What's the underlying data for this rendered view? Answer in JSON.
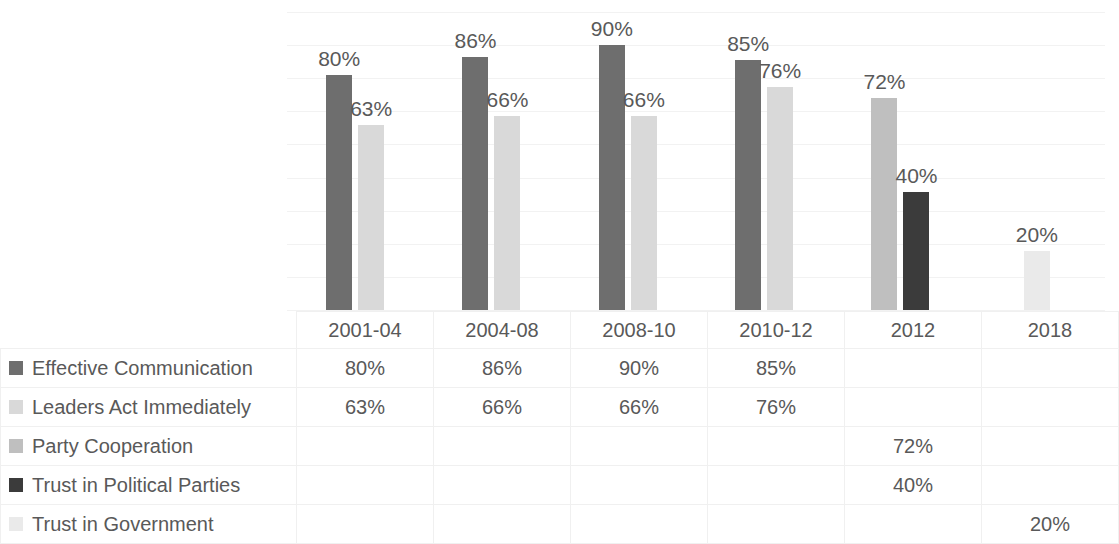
{
  "chart_data": {
    "type": "bar",
    "title": "",
    "subtitle": "",
    "xlabel": "",
    "ylabel": "",
    "ylim": [
      0,
      100
    ],
    "grid": true,
    "legend_position": "table-left",
    "categories": [
      "2001-04",
      "2004-08",
      "2008-10",
      "2010-12",
      "2012",
      "2018"
    ],
    "series": [
      {
        "name": "Effective Communication",
        "color": "#6e6e6e",
        "values": [
          80,
          86,
          90,
          85,
          null,
          null
        ],
        "labels": [
          "80%",
          "86%",
          "90%",
          "85%",
          "",
          ""
        ]
      },
      {
        "name": "Leaders Act Immediately",
        "color": "#d9d9d9",
        "values": [
          63,
          66,
          66,
          76,
          null,
          null
        ],
        "labels": [
          "63%",
          "66%",
          "66%",
          "76%",
          "",
          ""
        ]
      },
      {
        "name": "Party Cooperation",
        "color": "#bfbfbf",
        "values": [
          null,
          null,
          null,
          null,
          72,
          null
        ],
        "labels": [
          "",
          "",
          "",
          "",
          "72%",
          ""
        ]
      },
      {
        "name": "Trust in Political Parties",
        "color": "#3b3b3b",
        "values": [
          null,
          null,
          null,
          null,
          40,
          null
        ],
        "labels": [
          "",
          "",
          "",
          "",
          "40%",
          ""
        ]
      },
      {
        "name": "Trust in Government",
        "color": "#eaeaea",
        "values": [
          null,
          null,
          null,
          null,
          null,
          20
        ],
        "labels": [
          "",
          "",
          "",
          "",
          "",
          "20%"
        ]
      }
    ]
  },
  "table": {
    "header": [
      "",
      "2001-04",
      "2004-08",
      "2008-10",
      "2010-12",
      "2012",
      "2018"
    ],
    "rows": [
      {
        "label": "Effective Communication",
        "swatch_color": "#6e6e6e",
        "swatch_name": "legend-swatch-effective-communication",
        "values": [
          "80%",
          "86%",
          "90%",
          "85%",
          "",
          ""
        ]
      },
      {
        "label": "Leaders Act Immediately",
        "swatch_color": "#d9d9d9",
        "swatch_name": "legend-swatch-leaders-act-immediately",
        "values": [
          "63%",
          "66%",
          "66%",
          "76%",
          "",
          ""
        ]
      },
      {
        "label": "Party Cooperation",
        "swatch_color": "#bfbfbf",
        "swatch_name": "legend-swatch-party-cooperation",
        "values": [
          "",
          "",
          "",
          "",
          "72%",
          ""
        ]
      },
      {
        "label": "Trust in Political Parties",
        "swatch_color": "#3b3b3b",
        "swatch_name": "legend-swatch-trust-in-political-parties",
        "values": [
          "",
          "",
          "",
          "",
          "40%",
          ""
        ]
      },
      {
        "label": "Trust in Government",
        "swatch_color": "#eaeaea",
        "swatch_name": "legend-swatch-trust-in-government",
        "values": [
          "",
          "",
          "",
          "",
          "",
          "20%"
        ]
      }
    ]
  },
  "colors": {
    "text": "#595959",
    "gridline": "#f2f2f2",
    "table_border": "#f0f0f0",
    "background": "#ffffff"
  },
  "scale": {
    "baseline_y": 310,
    "px_per_percent": 2.94,
    "gridline_count": 9
  }
}
